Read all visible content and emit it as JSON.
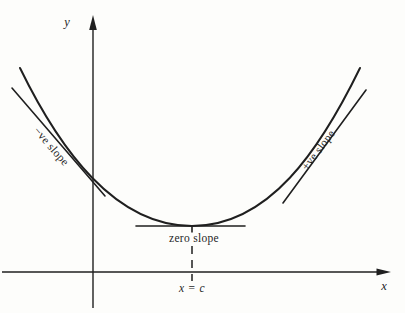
{
  "figure": {
    "colors": {
      "background": "#fdfdfb",
      "ink": "#1f1f1f"
    },
    "axes": {
      "x_label": "x",
      "y_label": "y"
    },
    "labels": {
      "negative_slope": "−ve slope",
      "zero_slope": "zero slope",
      "positive_slope": "+ve slope",
      "minimum_x": "x = c"
    },
    "curve": {
      "type": "u-shaped curve with minimum at x = c",
      "tangents": [
        "negative slope tangent (left)",
        "zero slope tangent (bottom)",
        "positive slope tangent (right)"
      ]
    }
  }
}
